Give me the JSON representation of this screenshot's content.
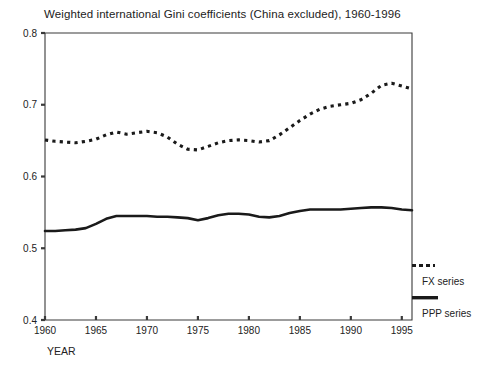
{
  "chart_data": {
    "type": "line",
    "title": "Weighted international Gini coefficients (China excluded), 1960-1996",
    "xlabel": "YEAR",
    "ylabel": "",
    "xlim": [
      1960,
      1996
    ],
    "ylim": [
      0.4,
      0.8
    ],
    "grid": false,
    "legend_position": "right",
    "xticks": [
      1960,
      1965,
      1970,
      1975,
      1980,
      1985,
      1990,
      1995
    ],
    "xtick_labels": [
      "1960",
      "1965",
      "1970",
      "1975",
      "1980",
      "1985",
      "1990",
      "1995"
    ],
    "yticks": [
      0.4,
      0.5,
      0.6,
      0.7,
      0.8
    ],
    "ytick_labels": [
      "0.4",
      "0.5",
      "0.6",
      "0.7",
      "0.8"
    ],
    "x": [
      1960,
      1961,
      1962,
      1963,
      1964,
      1965,
      1966,
      1967,
      1968,
      1969,
      1970,
      1971,
      1972,
      1973,
      1974,
      1975,
      1976,
      1977,
      1978,
      1979,
      1980,
      1981,
      1982,
      1983,
      1984,
      1985,
      1986,
      1987,
      1988,
      1989,
      1990,
      1991,
      1992,
      1993,
      1994,
      1995,
      1996
    ],
    "series": [
      {
        "name": "FX series",
        "style": "dotted",
        "color": "#1a1a1a",
        "values": [
          0.651,
          0.649,
          0.648,
          0.647,
          0.649,
          0.652,
          0.658,
          0.662,
          0.659,
          0.661,
          0.663,
          0.661,
          0.655,
          0.645,
          0.638,
          0.637,
          0.642,
          0.647,
          0.65,
          0.651,
          0.65,
          0.648,
          0.65,
          0.658,
          0.668,
          0.678,
          0.687,
          0.694,
          0.698,
          0.7,
          0.702,
          0.707,
          0.716,
          0.727,
          0.73,
          0.726,
          0.722
        ]
      },
      {
        "name": "PPP series",
        "style": "solid",
        "color": "#1a1a1a",
        "values": [
          0.524,
          0.524,
          0.525,
          0.526,
          0.528,
          0.534,
          0.541,
          0.545,
          0.545,
          0.545,
          0.545,
          0.544,
          0.544,
          0.543,
          0.542,
          0.539,
          0.542,
          0.546,
          0.548,
          0.548,
          0.547,
          0.544,
          0.543,
          0.545,
          0.549,
          0.552,
          0.554,
          0.554,
          0.554,
          0.554,
          0.555,
          0.556,
          0.557,
          0.557,
          0.556,
          0.554,
          0.553
        ]
      }
    ]
  },
  "legend": {
    "entries": [
      {
        "label": "FX series",
        "marker": "dotted-swatch"
      },
      {
        "label": "PPP series",
        "marker": "solid-swatch"
      }
    ]
  }
}
